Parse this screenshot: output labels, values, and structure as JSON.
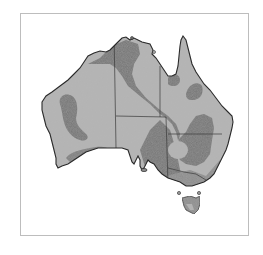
{
  "map": {
    "subject": "Australia",
    "style": "grayscale choropleth",
    "colors": {
      "frame": "#bdbdbd",
      "land_light": "#b3b3b3",
      "land_dark": "#727272",
      "outline": "#2a2a2a",
      "borders": "#3a3a3a"
    },
    "regions": [
      "Western Australia",
      "Northern Territory",
      "Queensland",
      "South Australia",
      "New South Wales",
      "Victoria",
      "Tasmania"
    ],
    "legend": null
  }
}
